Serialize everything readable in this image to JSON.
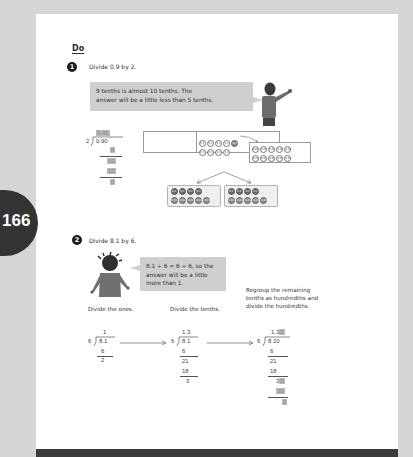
{
  "page": {
    "number": "166",
    "section_heading": "Do"
  },
  "question1": {
    "number": "1",
    "prompt": "Divide 0.9 by 2.",
    "speech_bubble": {
      "line1": "9 tenths is almost 10 tenths. The",
      "line2": "answer will be a little less than 5 tenths."
    },
    "long_division": {
      "divisor": "2",
      "dividend": "0.9",
      "dividend_appended": "0",
      "quotient": "0.45",
      "steps": [
        "8",
        "10",
        "10",
        "0"
      ]
    },
    "place_value_chart": {
      "tenths_counter_label": "0.1",
      "tenths_row1_count": 5,
      "tenths_row2_count": 4,
      "hundredths_counter_label": "0.01",
      "hundredths_count": 10
    },
    "split_groups": {
      "group_count": 2,
      "tenths_per_group": 4,
      "hundredths_per_group": 5,
      "tenths_label": "0.1",
      "hundredths_label": "0.01"
    }
  },
  "question2": {
    "number": "2",
    "prompt": "Divide 8.1 by 6.",
    "speech_bubble": {
      "line1": "8.1 ÷ 6 ≈ 6 ÷ 6, so the",
      "line2": "answer will be a little",
      "line3": "more than 1."
    },
    "steps": [
      {
        "caption": "Divide the ones.",
        "divisor": "6",
        "dividend": "8.1",
        "quotient": "1",
        "work": [
          "6",
          "2"
        ]
      },
      {
        "caption": "Divide the tenths.",
        "divisor": "6",
        "dividend": "8.1",
        "quotient": "1.3",
        "work": [
          "6",
          "21",
          "18",
          "3"
        ]
      },
      {
        "caption_line1": "Regroup the remaining",
        "caption_line2": "tenths as hundredths and",
        "caption_line3": "divide the hundredths.",
        "divisor": "6",
        "dividend": "8.1",
        "dividend_appended": "0",
        "quotient": "1.3",
        "quotient_appended": "5",
        "work": [
          "6",
          "21",
          "18",
          "3",
          "0",
          "30",
          "0"
        ]
      }
    ]
  },
  "colors": {
    "background": "#d6d6d6",
    "page": "#ffffff",
    "bubble": "#cfcfcf",
    "tab": "#333333",
    "highlight": "#b9b9b9"
  }
}
